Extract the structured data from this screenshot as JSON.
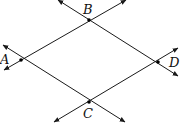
{
  "diagram": {
    "type": "intersecting-lines-rhombus",
    "points": [
      {
        "id": "A",
        "label": "A",
        "x": 21,
        "y": 60,
        "lx": 0,
        "ly": 64
      },
      {
        "id": "B",
        "label": "B",
        "x": 89,
        "y": 20,
        "lx": 83,
        "ly": 14
      },
      {
        "id": "C",
        "label": "C",
        "x": 89,
        "y": 102,
        "lx": 83,
        "ly": 118
      },
      {
        "id": "D",
        "label": "D",
        "x": 158,
        "y": 62,
        "lx": 169,
        "ly": 67
      }
    ],
    "lines": [
      {
        "through": [
          "A",
          "B"
        ],
        "x1": 4,
        "y1": 70,
        "x2": 126,
        "y2": 0
      },
      {
        "through": [
          "B",
          "D"
        ],
        "x1": 58,
        "y1": 0,
        "x2": 178,
        "y2": 76
      },
      {
        "through": [
          "A",
          "C"
        ],
        "x1": 3,
        "y1": 45,
        "x2": 125,
        "y2": 122
      },
      {
        "through": [
          "C",
          "D"
        ],
        "x1": 54,
        "y1": 122,
        "x2": 178,
        "y2": 48
      }
    ],
    "colors": {
      "stroke": "#1a1a1a",
      "point": "#000000"
    }
  }
}
